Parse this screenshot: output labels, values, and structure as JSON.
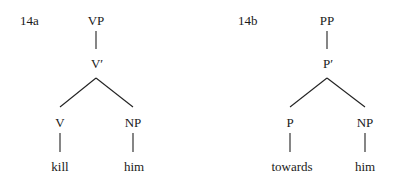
{
  "trees": [
    {
      "id": "14a",
      "label": "14a",
      "root": "VP",
      "bar": "V′",
      "head": "V",
      "complement": "NP",
      "head_word": "kill",
      "complement_word": "him"
    },
    {
      "id": "14b",
      "label": "14b",
      "root": "PP",
      "bar": "P′",
      "head": "P",
      "complement": "NP",
      "head_word": "towards",
      "complement_word": "him"
    }
  ]
}
